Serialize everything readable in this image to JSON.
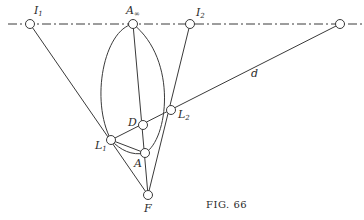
{
  "figure": {
    "caption": "Fig. 66",
    "caption_display": "FIG. 66",
    "colors": {
      "ink": "#3a3a3a",
      "background": "#ffffff"
    },
    "horizon_line": {
      "style": "dash-dot",
      "y": 24,
      "x_start": 8,
      "x_end": 362
    },
    "points": [
      {
        "id": "I1",
        "label": "I",
        "sub": "1",
        "x": 30,
        "y": 24
      },
      {
        "id": "A_inf",
        "label": "A",
        "sub": "∞",
        "x": 133,
        "y": 24
      },
      {
        "id": "I2",
        "label": "I",
        "sub": "2",
        "x": 190,
        "y": 24
      },
      {
        "id": "R",
        "label": "",
        "sub": "",
        "x": 340,
        "y": 24
      },
      {
        "id": "L2",
        "label": "L",
        "sub": "2",
        "x": 171,
        "y": 110
      },
      {
        "id": "D",
        "label": "D",
        "sub": "",
        "x": 143,
        "y": 125
      },
      {
        "id": "L1",
        "label": "L",
        "sub": "1",
        "x": 111,
        "y": 140
      },
      {
        "id": "A",
        "label": "A",
        "sub": "",
        "x": 145,
        "y": 153
      },
      {
        "id": "F",
        "label": "F",
        "sub": "",
        "x": 148,
        "y": 195
      }
    ],
    "line_label": {
      "text": "d",
      "x": 254,
      "y": 76
    },
    "labels": {
      "I1": "I",
      "I1_sub": "1",
      "A_inf": "A",
      "A_inf_sub": "∞",
      "I2": "I",
      "I2_sub": "2",
      "L1": "L",
      "L1_sub": "1",
      "L2": "L",
      "L2_sub": "2",
      "D": "D",
      "A": "A",
      "F": "F",
      "d": "d"
    }
  }
}
